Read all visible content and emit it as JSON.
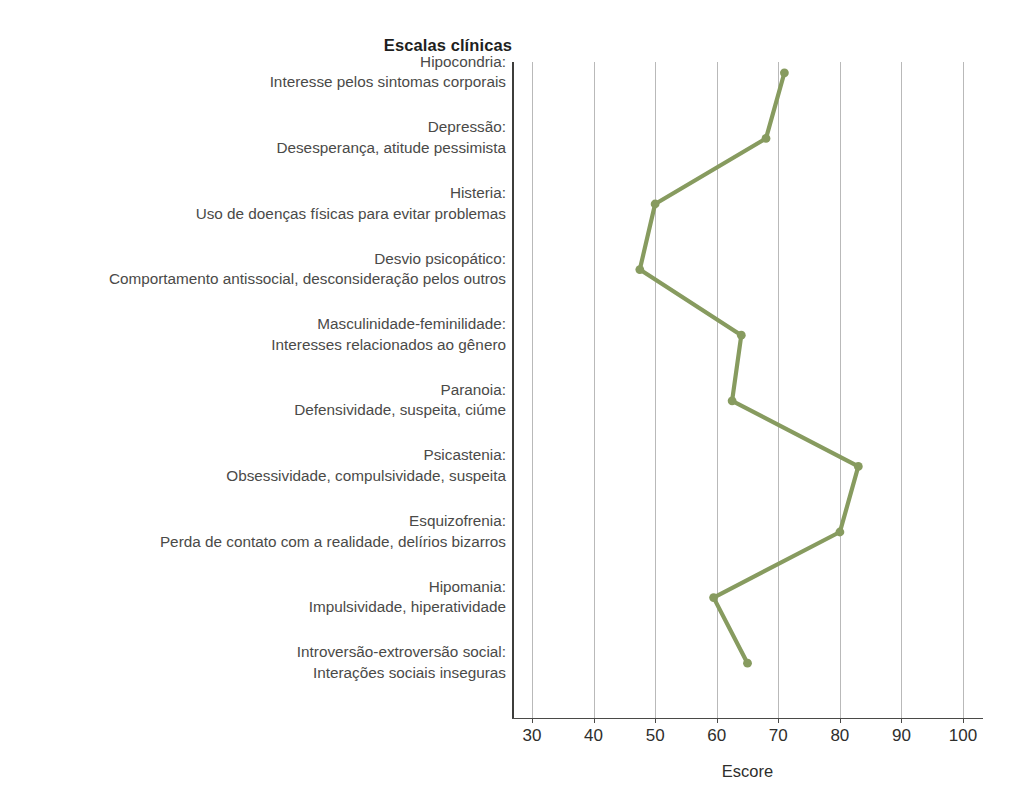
{
  "chart_title": "Escalas clínicas",
  "x_axis_title": "Escore",
  "axis": {
    "ticks": [
      30,
      40,
      50,
      60,
      70,
      80,
      90,
      100
    ],
    "tick_labels": [
      "30",
      "40",
      "50",
      "60",
      "70",
      "80",
      "90",
      "100"
    ]
  },
  "style": {
    "series_color": "#879B5F",
    "gridline_color": "#b9b9b9",
    "axis_color": "#4a4a48",
    "text_color": "#4a4a48",
    "title_color": "#1f1f1e",
    "background": "#ffffff"
  },
  "categories": [
    {
      "name": "Hipocondria:",
      "desc": "Interesse pelos sintomas corporais"
    },
    {
      "name": "Depressão:",
      "desc": "Desesperança, atitude pessimista"
    },
    {
      "name": "Histeria:",
      "desc": "Uso de doenças físicas para evitar problemas"
    },
    {
      "name": "Desvio psicopático:",
      "desc": "Comportamento antissocial, desconsideração pelos outros"
    },
    {
      "name": "Masculinidade-feminilidade:",
      "desc": "Interesses relacionados ao gênero"
    },
    {
      "name": "Paranoia:",
      "desc": "Defensividade, suspeita, ciúme"
    },
    {
      "name": "Psicastenia:",
      "desc": "Obsessividade, compulsividade, suspeita"
    },
    {
      "name": "Esquizofrenia:",
      "desc": "Perda de contato com a realidade, delírios bizarros"
    },
    {
      "name": "Hipomania:",
      "desc": "Impulsividade, hiperatividade"
    },
    {
      "name": "Introversão-extroversão social:",
      "desc": "Interações sociais inseguras"
    }
  ],
  "chart_data": {
    "type": "line",
    "orientation": "horizontal",
    "title": "Escalas clínicas",
    "xlabel": "Escore",
    "ylabel": "",
    "xlim": [
      30,
      100
    ],
    "grid": true,
    "legend": "none",
    "categories": [
      "Hipocondria: Interesse pelos sintomas corporais",
      "Depressão: Desesperança, atitude pessimista",
      "Histeria: Uso de doenças físicas para evitar problemas",
      "Desvio psicopático: Comportamento antissocial, desconsideração pelos outros",
      "Masculinidade-feminilidade: Interesses relacionados ao gênero",
      "Paranoia: Defensividade, suspeita, ciúme",
      "Psicastenia: Obsessividade, compulsividade, suspeita",
      "Esquizofrenia: Perda de contato com a realidade, delírios bizarros",
      "Hipomania: Impulsividade, hiperatividade",
      "Introversão-extroversão social: Interações sociais inseguras"
    ],
    "values": [
      71,
      68,
      50,
      47.5,
      64,
      62.5,
      83,
      80,
      59.5,
      65
    ],
    "xticks": [
      30,
      40,
      50,
      60,
      70,
      80,
      90,
      100
    ],
    "series": [
      {
        "name": "Escore",
        "values": [
          71,
          68,
          50,
          47.5,
          64,
          62.5,
          83,
          80,
          59.5,
          65
        ]
      }
    ]
  }
}
